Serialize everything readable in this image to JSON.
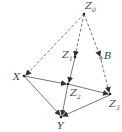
{
  "nodes": {
    "Z0": {
      "label": "Z",
      "sub": "0"
    },
    "Z1": {
      "label": "Z",
      "sub": "1"
    },
    "B": {
      "label": "B",
      "sub": ""
    },
    "X": {
      "label": "X",
      "sub": ""
    },
    "Z2": {
      "label": "Z",
      "sub": "2"
    },
    "Z3": {
      "label": "Z",
      "sub": "3"
    },
    "Y": {
      "label": "Y",
      "sub": ""
    }
  },
  "edges": [
    {
      "from": "Z0",
      "to": "X",
      "style": "dashed"
    },
    {
      "from": "Z0",
      "to": "Z1",
      "style": "dashed"
    },
    {
      "from": "Z0",
      "to": "B",
      "style": "dashed"
    },
    {
      "from": "Z1",
      "to": "Z2",
      "style": "solid"
    },
    {
      "from": "B",
      "to": "Z3",
      "style": "dashed"
    },
    {
      "from": "X",
      "to": "Z2",
      "style": "solid"
    },
    {
      "from": "X",
      "to": "Y",
      "style": "solid"
    },
    {
      "from": "Z2",
      "to": "Z3",
      "style": "solid"
    },
    {
      "from": "Z2",
      "to": "Y",
      "style": "solid"
    },
    {
      "from": "Z3",
      "to": "Y",
      "style": "solid"
    }
  ]
}
